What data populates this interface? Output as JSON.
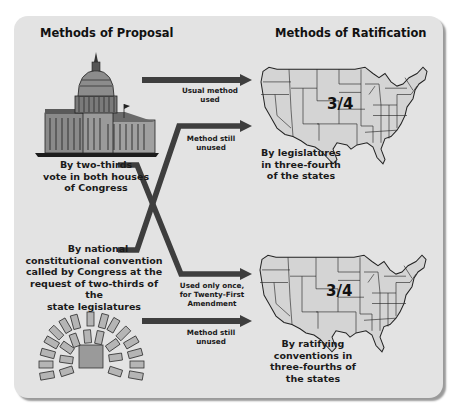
{
  "diagram": {
    "colors": {
      "background": "#ffffff",
      "panel": "#e3e3e3",
      "arrow": "#3e3e3e",
      "map_fill": "#d4d4d4",
      "map_stroke": "#222222",
      "seat_fill": "#b5b5b5",
      "text": "#111111"
    },
    "headings": {
      "proposal": "Methods of Proposal",
      "ratification": "Methods of Ratification"
    },
    "proposal_methods": [
      {
        "id": "congress",
        "icon": "capitol-building-icon",
        "label_lines": [
          "By two-thirds",
          "vote in both houses",
          "of Congress"
        ]
      },
      {
        "id": "convention",
        "icon": "convention-seating-icon",
        "label_lines": [
          "By national",
          "constitutional convention",
          "called by Congress at the",
          "request of two-thirds of the",
          "state legislatures"
        ]
      }
    ],
    "paths": [
      {
        "from": "congress",
        "to": "legislatures",
        "label_lines": [
          "Usual method",
          "used"
        ]
      },
      {
        "from": "convention",
        "to": "legislatures",
        "label_lines": [
          "Method still",
          "unused"
        ]
      },
      {
        "from": "congress",
        "to": "conventions",
        "label_lines": [
          "Used only once,",
          "for Twenty-First",
          "Amendment"
        ]
      },
      {
        "from": "convention",
        "to": "conventions",
        "label_lines": [
          "Method still",
          "unused"
        ]
      }
    ],
    "ratification_methods": [
      {
        "id": "legislatures",
        "icon": "us-map-icon",
        "fraction": "3/4",
        "label_lines": [
          "By legislatures",
          "in three-fourth",
          "of the states"
        ]
      },
      {
        "id": "conventions",
        "icon": "us-map-icon",
        "fraction": "3/4",
        "label_lines": [
          "By ratifying",
          "conventions in",
          "three-fourths of",
          "the states"
        ]
      }
    ]
  }
}
